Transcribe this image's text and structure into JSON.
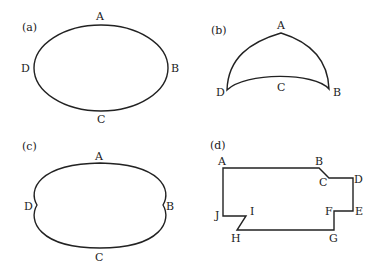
{
  "panels": [
    {
      "id": "a",
      "caption": "(a)",
      "shape": "ellipse",
      "points": {
        "A": "A",
        "B": "B",
        "C": "C",
        "D": "D"
      }
    },
    {
      "id": "b",
      "caption": "(b)",
      "shape": "curved-triangle",
      "points": {
        "A": "A",
        "B": "B",
        "C": "C",
        "D": "D"
      }
    },
    {
      "id": "c",
      "caption": "(c)",
      "shape": "ellipse-with-cusps",
      "points": {
        "A": "A",
        "B": "B",
        "C": "C",
        "D": "D"
      }
    },
    {
      "id": "d",
      "caption": "(d)",
      "shape": "polygon",
      "points": {
        "A": "A",
        "B": "B",
        "C": "C",
        "D": "D",
        "E": "E",
        "F": "F",
        "G": "G",
        "H": "H",
        "I": "I",
        "J": "J"
      }
    }
  ],
  "colors": {
    "stroke": "#222222",
    "background": "#ffffff"
  }
}
